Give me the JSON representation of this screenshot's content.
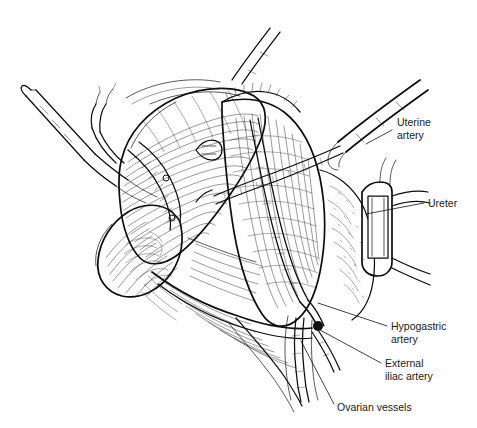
{
  "figure": {
    "background_color": "#ffffff",
    "ink_color": "#111111",
    "style": "pen-and-ink line drawing with cross-hatching",
    "width": 477,
    "height": 428
  },
  "labels": [
    {
      "id": "uterine-artery",
      "line1": "Uterine",
      "line2": "artery",
      "text_x": 397,
      "text_y": 126,
      "leader": "M392,130 L366,144"
    },
    {
      "id": "ureter",
      "line1": "Ureter",
      "line2": "",
      "text_x": 428,
      "text_y": 207,
      "leader": "M424,203 L366,214"
    },
    {
      "id": "hypogastric-artery",
      "line1": "Hypogastric",
      "line2": "artery",
      "text_x": 391,
      "text_y": 330,
      "leader": "M387,326 L318,303"
    },
    {
      "id": "external-iliac-artery",
      "line1": "External",
      "line2": "iliac artery",
      "text_x": 385,
      "text_y": 367,
      "leader": "M381,363 L320,330"
    },
    {
      "id": "ovarian-vessels",
      "line1": "Ovarian vessels",
      "line2": "",
      "text_x": 337,
      "text_y": 411,
      "leader": "M334,404 L301,341"
    }
  ],
  "structures": [
    {
      "name": "uterus-body",
      "description": "large hatched uterine corpus, upper left of field"
    },
    {
      "name": "ovary",
      "description": "ovoid ovary suspended at left on infundibulopelvic ligament"
    },
    {
      "name": "fallopian-tube",
      "description": "tube curving over the ovary"
    },
    {
      "name": "round-ligament",
      "description": "band crossing the broad ligament"
    },
    {
      "name": "broad-ligament-leaf",
      "description": "opened peritoneal leaf exposing pararectal space"
    },
    {
      "name": "pelvic-sidewall",
      "description": "stippled sidewall with iliac vessel bed"
    },
    {
      "name": "uterine-artery-vessel",
      "description": "artery crossing the ureter"
    },
    {
      "name": "ureter-vessel",
      "description": "ureter running along the medial leaf"
    },
    {
      "name": "hypogastric-artery-vessel",
      "description": "internal iliac artery at the bifurcation"
    },
    {
      "name": "external-iliac-vessel",
      "description": "external iliac artery descending laterally"
    },
    {
      "name": "ovarian-vessels-bundle",
      "description": "ovarian vascular pedicle descending inferiorly"
    },
    {
      "name": "tenaculum-clamp",
      "description": "long surgical clamp entering from upper left"
    },
    {
      "name": "traction-instrument",
      "description": "instrument shaft entering from upper right"
    },
    {
      "name": "sidewall-retractor",
      "description": "rectangular vein retractor blade at right margin"
    }
  ]
}
